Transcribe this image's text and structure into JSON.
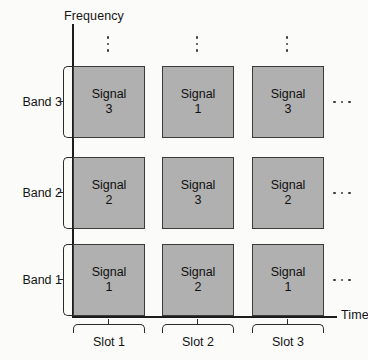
{
  "figure": {
    "background": "#fbfbfa",
    "cell_fill": "#b0b0b0",
    "cell_stroke": "#3b3b3b",
    "axis_color": "#1c1c1c"
  },
  "axes": {
    "y_label": "Frequency",
    "x_label": "Time"
  },
  "bands": [
    {
      "label": "Band 3"
    },
    {
      "label": "Band 2"
    },
    {
      "label": "Band 1"
    }
  ],
  "slots": [
    {
      "label": "Slot 1"
    },
    {
      "label": "Slot 2"
    },
    {
      "label": "Slot 3"
    }
  ],
  "grid": {
    "signal_word": "Signal",
    "rows": [
      {
        "band": "Band 3",
        "cells": [
          {
            "word": "Signal",
            "number": "3"
          },
          {
            "word": "Signal",
            "number": "1"
          },
          {
            "word": "Signal",
            "number": "3"
          }
        ],
        "continues": "…"
      },
      {
        "band": "Band 2",
        "cells": [
          {
            "word": "Signal",
            "number": "2"
          },
          {
            "word": "Signal",
            "number": "3"
          },
          {
            "word": "Signal",
            "number": "2"
          }
        ],
        "continues": "…"
      },
      {
        "band": "Band 1",
        "cells": [
          {
            "word": "Signal",
            "number": "1"
          },
          {
            "word": "Signal",
            "number": "2"
          },
          {
            "word": "Signal",
            "number": "1"
          }
        ],
        "continues": "…"
      }
    ]
  },
  "ellipses": {
    "vertical_symbol": "⋮",
    "horizontal_symbol": "⋯",
    "vertical_count": 3,
    "horizontal_count": 3
  }
}
